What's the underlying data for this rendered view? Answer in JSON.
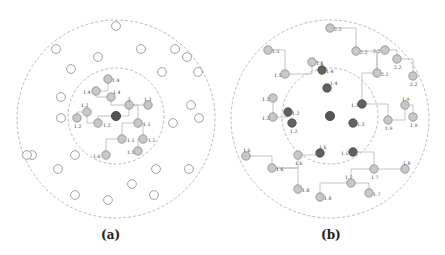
{
  "figure": {
    "panels": [
      {
        "caption": "(a)",
        "nodes": [
          {
            "id": "a-c",
            "state": "root",
            "label": ""
          },
          {
            "id": "a1",
            "state": "gray",
            "label": "1.4"
          },
          {
            "id": "a2",
            "state": "gray",
            "label": "1.4"
          },
          {
            "id": "a3",
            "state": "gray",
            "label": "1.4"
          },
          {
            "id": "a4",
            "state": "gray",
            "label": "1"
          },
          {
            "id": "a5",
            "state": "gray",
            "label": "1.3"
          },
          {
            "id": "a6",
            "state": "gray",
            "label": "1.2"
          },
          {
            "id": "a7",
            "state": "gray",
            "label": "1.2"
          },
          {
            "id": "a8",
            "state": "gray",
            "label": "1.2"
          },
          {
            "id": "a9",
            "state": "gray",
            "label": "1.5"
          },
          {
            "id": "a10",
            "state": "gray",
            "label": "1.5"
          },
          {
            "id": "a11",
            "state": "gray",
            "label": "1.5"
          },
          {
            "id": "a12",
            "state": "gray",
            "label": "1.5"
          },
          {
            "id": "a13",
            "state": "gray",
            "label": "1.6"
          },
          {
            "id": "o1",
            "state": "empty",
            "label": ""
          },
          {
            "id": "o2",
            "state": "empty",
            "label": ""
          },
          {
            "id": "o3",
            "state": "empty",
            "label": ""
          },
          {
            "id": "o4",
            "state": "empty",
            "label": ""
          },
          {
            "id": "o5",
            "state": "empty",
            "label": ""
          },
          {
            "id": "o6",
            "state": "empty",
            "label": ""
          },
          {
            "id": "o7",
            "state": "empty",
            "label": ""
          },
          {
            "id": "o8",
            "state": "empty",
            "label": ""
          },
          {
            "id": "o9",
            "state": "empty",
            "label": ""
          },
          {
            "id": "o10",
            "state": "empty",
            "label": ""
          },
          {
            "id": "o11",
            "state": "empty",
            "label": ""
          },
          {
            "id": "o12",
            "state": "empty",
            "label": ""
          },
          {
            "id": "o13",
            "state": "empty",
            "label": ""
          },
          {
            "id": "o14",
            "state": "empty",
            "label": ""
          },
          {
            "id": "o15",
            "state": "empty",
            "label": ""
          },
          {
            "id": "o16",
            "state": "empty",
            "label": ""
          },
          {
            "id": "o17",
            "state": "empty",
            "label": ""
          },
          {
            "id": "o18",
            "state": "empty",
            "label": ""
          },
          {
            "id": "o19",
            "state": "empty",
            "label": ""
          },
          {
            "id": "o20",
            "state": "empty",
            "label": ""
          },
          {
            "id": "o21",
            "state": "empty",
            "label": ""
          },
          {
            "id": "o22",
            "state": "empty",
            "label": ""
          },
          {
            "id": "o23",
            "state": "empty",
            "label": ""
          },
          {
            "id": "o24",
            "state": "empty",
            "label": ""
          }
        ],
        "edges": [
          [
            "a-c",
            "a4"
          ],
          [
            "a-c",
            "a7"
          ],
          [
            "a4",
            "a5"
          ],
          [
            "a4",
            "a9"
          ],
          [
            "a4",
            "a3"
          ],
          [
            "a3",
            "a2"
          ],
          [
            "a2",
            "a1"
          ],
          [
            "a7",
            "a6"
          ],
          [
            "a6",
            "a8"
          ],
          [
            "a9",
            "a10"
          ],
          [
            "a9",
            "a11"
          ],
          [
            "a10",
            "a13"
          ],
          [
            "a11",
            "a12"
          ]
        ]
      },
      {
        "caption": "(b)",
        "nodes": [
          {
            "id": "b-c",
            "state": "root",
            "label": ""
          },
          {
            "id": "b1",
            "state": "dark",
            "label": "1.4"
          },
          {
            "id": "b2",
            "state": "dark",
            "label": "1.4"
          },
          {
            "id": "b3",
            "state": "dark",
            "label": "1.2"
          },
          {
            "id": "b4",
            "state": "dark",
            "label": "1.2"
          },
          {
            "id": "b5",
            "state": "dark",
            "label": "1.3"
          },
          {
            "id": "b6",
            "state": "dark",
            "label": "1.3"
          },
          {
            "id": "b7",
            "state": "dark",
            "label": "1.6"
          },
          {
            "id": "b8",
            "state": "dark",
            "label": "1.5"
          },
          {
            "id": "g1",
            "state": "gray",
            "label": "2.2"
          },
          {
            "id": "g2",
            "state": "gray",
            "label": "2.2"
          },
          {
            "id": "g3",
            "state": "gray",
            "label": "2.2"
          },
          {
            "id": "g4",
            "state": "gray",
            "label": "2.2"
          },
          {
            "id": "g5",
            "state": "gray",
            "label": "2.2"
          },
          {
            "id": "g6",
            "state": "gray",
            "label": "2.2"
          },
          {
            "id": "g7",
            "state": "gray",
            "label": "1.5"
          },
          {
            "id": "g8",
            "state": "gray",
            "label": "1.5"
          },
          {
            "id": "g9",
            "state": "gray",
            "label": "1.6"
          },
          {
            "id": "g10",
            "state": "gray",
            "label": "1.2"
          },
          {
            "id": "g11",
            "state": "gray",
            "label": "1.2"
          },
          {
            "id": "g12",
            "state": "gray",
            "label": "1.9"
          },
          {
            "id": "g13",
            "state": "gray",
            "label": "1.9"
          },
          {
            "id": "g14",
            "state": "gray",
            "label": "1.9"
          },
          {
            "id": "g15",
            "state": "gray",
            "label": "1.6"
          },
          {
            "id": "g16",
            "state": "gray",
            "label": "1.6"
          },
          {
            "id": "g17",
            "state": "gray",
            "label": "1.6"
          },
          {
            "id": "g18",
            "state": "gray",
            "label": "1.8"
          },
          {
            "id": "g19",
            "state": "gray",
            "label": "1.7"
          },
          {
            "id": "g20",
            "state": "gray",
            "label": "1.8"
          },
          {
            "id": "g21",
            "state": "gray",
            "label": "1.7"
          },
          {
            "id": "g22",
            "state": "gray",
            "label": "1.8"
          },
          {
            "id": "g23",
            "state": "gray",
            "label": "1.7"
          }
        ],
        "edges": [
          [
            "g1",
            "g2"
          ],
          [
            "g2",
            "g5"
          ],
          [
            "g3",
            "g5"
          ],
          [
            "g3",
            "g4"
          ],
          [
            "g4",
            "g6"
          ],
          [
            "g5",
            "b6"
          ],
          [
            "g7",
            "g8"
          ],
          [
            "g8",
            "g9"
          ],
          [
            "g9",
            "b1"
          ],
          [
            "g10",
            "g11"
          ],
          [
            "g11",
            "b4"
          ],
          [
            "b6",
            "g14"
          ],
          [
            "g14",
            "g12"
          ],
          [
            "g12",
            "g13"
          ],
          [
            "g15",
            "g16"
          ],
          [
            "g16",
            "g17"
          ],
          [
            "g17",
            "b7"
          ],
          [
            "g16",
            "g18"
          ],
          [
            "b8",
            "g19"
          ],
          [
            "g19",
            "g20"
          ],
          [
            "g19",
            "g21"
          ],
          [
            "g21",
            "g22"
          ],
          [
            "g21",
            "g23"
          ]
        ]
      }
    ]
  }
}
